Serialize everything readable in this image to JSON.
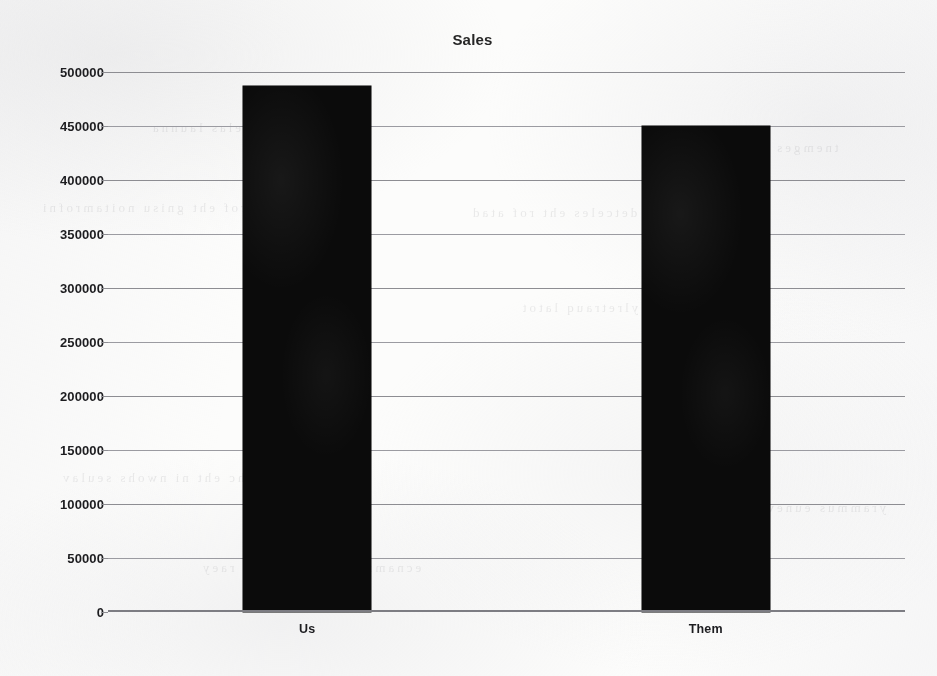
{
  "chart_data": {
    "type": "bar",
    "title": "Sales",
    "xlabel": "",
    "ylabel": "",
    "categories": [
      "Us",
      "Them"
    ],
    "values": [
      487000,
      450000
    ],
    "series": [
      {
        "name": "Sales",
        "values": [
          487000,
          450000
        ]
      }
    ],
    "ylim": [
      0,
      500000
    ],
    "y_tick_step": 50000,
    "y_tick_labels": [
      "500000",
      "450000",
      "400000",
      "350000",
      "300000",
      "250000",
      "200000",
      "150000",
      "100000",
      "50000",
      "0"
    ],
    "y_tick_values": [
      500000,
      450000,
      400000,
      350000,
      300000,
      250000,
      200000,
      150000,
      100000,
      50000,
      0
    ],
    "grid": "horizontal",
    "legend": "none",
    "colors": {
      "bar": "#0b0b0b",
      "gridline": "#8d8d92",
      "axis": "#7d7d83",
      "text": "#1d1d20",
      "paper": "#fcfcfb"
    }
  },
  "ghost_text": {
    "note": "faint bleed-through from reverse side of scanned page",
    "rows": [
      "smrof eht gnisu noitamrofni",
      "detceles eht rof atad",
      "trahc eht ni nwohs seulav",
      "stluser ylretrauq latot",
      "nosirapmoc selas launna",
      "tnemges yb erahs tekram",
      "ecnamrofrep raey revo raey",
      "yrammus eunever ssorg"
    ]
  }
}
